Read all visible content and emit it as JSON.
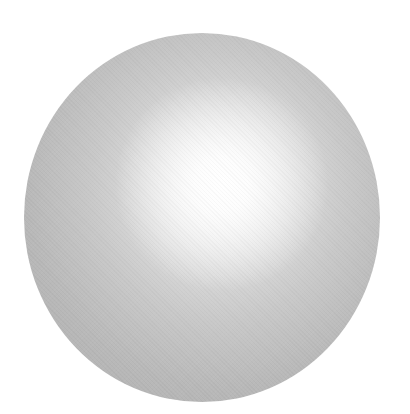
{
  "image": {
    "subject": "gray sphere with radial highlight",
    "background_color": "#ffffff",
    "sphere": {
      "edge_color": "#b0b0b0",
      "mid_color": "#c9c9c9",
      "highlight_color": "#ffffff"
    }
  }
}
